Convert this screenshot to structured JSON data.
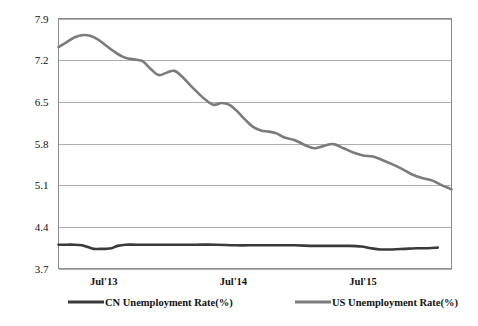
{
  "chart_data": {
    "type": "line",
    "title": "",
    "xlabel": "",
    "ylabel": "",
    "ylim": [
      3.7,
      7.9
    ],
    "yticks": [
      3.7,
      4.4,
      5.1,
      5.8,
      6.5,
      7.2,
      7.9
    ],
    "ytick_labels": [
      "3.7",
      "4.4",
      "5.1",
      "5.8",
      "6.5",
      "7.2",
      "7.9"
    ],
    "xtick_labels": [
      "Jul'13",
      "Jul'14",
      "Jul'15"
    ],
    "xtick_positions": [
      0.115,
      0.445,
      0.775
    ],
    "grid": true,
    "legend_position": "bottom",
    "series": [
      {
        "name": "CN Unemployment Rate(%)",
        "color": "#3a3a3a",
        "width": 2.6,
        "x": [
          0.0,
          0.02,
          0.04,
          0.06,
          0.075,
          0.09,
          0.105,
          0.12,
          0.135,
          0.15,
          0.17,
          0.2,
          0.25,
          0.3,
          0.35,
          0.4,
          0.45,
          0.5,
          0.55,
          0.6,
          0.65,
          0.7,
          0.74,
          0.77,
          0.795,
          0.82,
          0.85,
          0.88,
          0.91,
          0.94,
          0.965
        ],
        "values": [
          4.1,
          4.1,
          4.1,
          4.09,
          4.06,
          4.03,
          4.03,
          4.03,
          4.04,
          4.08,
          4.1,
          4.1,
          4.1,
          4.1,
          4.1,
          4.1,
          4.09,
          4.09,
          4.09,
          4.09,
          4.08,
          4.08,
          4.08,
          4.07,
          4.04,
          4.02,
          4.02,
          4.03,
          4.04,
          4.04,
          4.05
        ]
      },
      {
        "name": "US Unemployment Rate(%)",
        "color": "#7b7b7b",
        "width": 2.6,
        "x": [
          0.0,
          0.02,
          0.04,
          0.06,
          0.08,
          0.1,
          0.12,
          0.145,
          0.17,
          0.195,
          0.215,
          0.235,
          0.255,
          0.275,
          0.295,
          0.315,
          0.335,
          0.355,
          0.375,
          0.395,
          0.415,
          0.435,
          0.455,
          0.475,
          0.495,
          0.515,
          0.535,
          0.555,
          0.575,
          0.6,
          0.625,
          0.65,
          0.675,
          0.7,
          0.725,
          0.75,
          0.775,
          0.8,
          0.825,
          0.85,
          0.875,
          0.9,
          0.925,
          0.95,
          0.975,
          1.0
        ],
        "values": [
          7.42,
          7.5,
          7.58,
          7.62,
          7.61,
          7.55,
          7.45,
          7.33,
          7.24,
          7.21,
          7.18,
          7.05,
          6.95,
          6.99,
          7.02,
          6.92,
          6.78,
          6.65,
          6.53,
          6.45,
          6.48,
          6.45,
          6.34,
          6.2,
          6.08,
          6.02,
          6.0,
          5.97,
          5.9,
          5.86,
          5.78,
          5.72,
          5.76,
          5.79,
          5.72,
          5.65,
          5.6,
          5.58,
          5.52,
          5.45,
          5.37,
          5.28,
          5.22,
          5.18,
          5.1,
          5.03
        ],
        "dip_tail": [
          0.96,
          4.98,
          1.0,
          5.05
        ]
      }
    ],
    "legend": [
      {
        "label": "CN Unemployment Rate(%)",
        "color": "#3a3a3a"
      },
      {
        "label": "US Unemployment Rate(%)",
        "color": "#7b7b7b"
      }
    ],
    "colors": {
      "cn": "#3a3a3a",
      "us": "#7b7b7b",
      "grid": "#9a9a9a",
      "frame": "#8d8d8d",
      "text": "#111111",
      "background": "#ffffff"
    }
  }
}
